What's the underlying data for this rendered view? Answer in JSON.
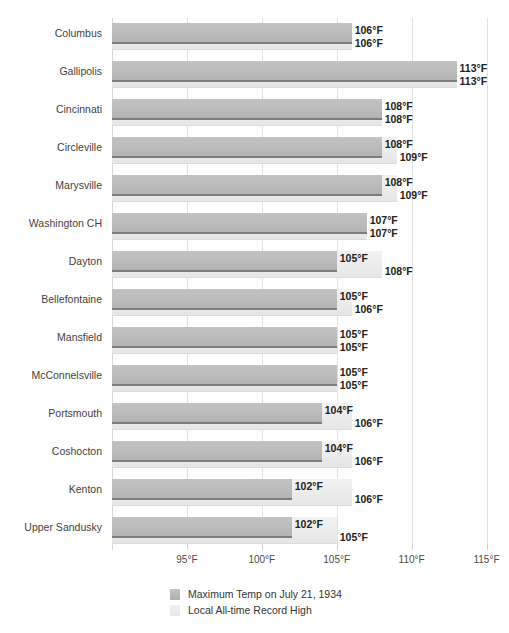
{
  "chart_data": {
    "type": "bar",
    "orientation": "horizontal",
    "title": "",
    "xlabel": "",
    "ylabel": "",
    "xlim": [
      90,
      115.5
    ],
    "grid": true,
    "legend_position": "bottom",
    "tick_labels": [
      "95°F",
      "100°F",
      "105°F",
      "110°F",
      "115°F"
    ],
    "tick_values": [
      95,
      100,
      105,
      110,
      115
    ],
    "categories": [
      "Columbus",
      "Gallipolis",
      "Cincinnati",
      "Circleville",
      "Marysville",
      "Washington CH",
      "Dayton",
      "Bellefontaine",
      "Mansfield",
      "McConnelsville",
      "Portsmouth",
      "Coshocton",
      "Kenton",
      "Upper Sandusky"
    ],
    "series": [
      {
        "name": "Maximum Temp on July 21, 1934",
        "color": "#b8b8b8",
        "values": [
          106,
          113,
          108,
          108,
          108,
          107,
          105,
          105,
          105,
          105,
          104,
          104,
          102,
          102
        ],
        "labels": [
          "106°F",
          "113°F",
          "108°F",
          "108°F",
          "108°F",
          "107°F",
          "105°F",
          "105°F",
          "105°F",
          "105°F",
          "104°F",
          "104°F",
          "102°F",
          "102°F"
        ]
      },
      {
        "name": "Local All-time Record High",
        "color": "#ececec",
        "values": [
          106,
          113,
          108,
          109,
          109,
          107,
          108,
          106,
          105,
          105,
          106,
          106,
          106,
          105
        ],
        "labels": [
          "106°F",
          "113°F",
          "108°F",
          "109°F",
          "109°F",
          "107°F",
          "108°F",
          "106°F",
          "105°F",
          "105°F",
          "106°F",
          "106°F",
          "106°F",
          "105°F"
        ]
      }
    ]
  },
  "legend": {
    "items": [
      {
        "label": "Maximum Temp on July 21, 1934"
      },
      {
        "label": "Local All-time Record High"
      }
    ]
  }
}
